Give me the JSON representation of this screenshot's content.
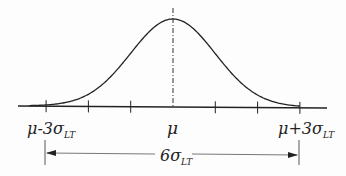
{
  "diagram": {
    "curve": {
      "type": "normal",
      "mean": 0,
      "sd": 1,
      "x_range_sd": [
        -3.4,
        3.0
      ]
    },
    "ticks_sd": [
      -3,
      -2,
      -1,
      0,
      1,
      2,
      3
    ],
    "labels": {
      "left": {
        "base": "μ-3σ",
        "sub": "LT"
      },
      "center": {
        "base": "μ"
      },
      "right": {
        "base": "μ+3σ",
        "sub": "LT"
      },
      "span": {
        "base": "6σ",
        "sub": "LT"
      }
    },
    "colors": {
      "ink": "#222222",
      "dim": "#555555"
    }
  }
}
